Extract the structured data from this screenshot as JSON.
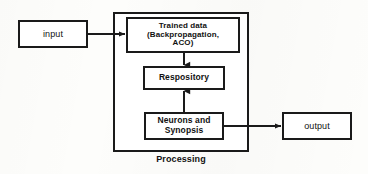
{
  "figure": {
    "type": "block-diagram",
    "background_color": "#fdfdfb",
    "stroke_color": "#1a1a1a",
    "fill_color": "#ffffff"
  },
  "nodes": {
    "input": {
      "label": "input",
      "shape": "rectangle"
    },
    "output": {
      "label": "output",
      "shape": "rectangle"
    },
    "trained_data": {
      "label": "Trained data\n(Backpropagation,\nACO)",
      "shape": "rectangle"
    },
    "respository": {
      "label": "Respository",
      "shape": "rectangle"
    },
    "neurons": {
      "label": "Neurons and\nSynopsis",
      "shape": "rectangle"
    }
  },
  "container": {
    "caption": "Processing",
    "shape": "rectangle"
  },
  "edges": [
    {
      "name": "input-to-trained-data",
      "from": "input",
      "to": "trained_data",
      "direction": "right",
      "arrowhead": true
    },
    {
      "name": "trained-data-to-respository",
      "from": "trained_data",
      "to": "respository",
      "direction": "down",
      "arrowhead": true
    },
    {
      "name": "neurons-to-respository",
      "from": "neurons",
      "to": "respository",
      "direction": "up",
      "arrowhead": true
    },
    {
      "name": "neurons-to-output",
      "from": "neurons",
      "to": "output",
      "direction": "right",
      "arrowhead": true
    }
  ]
}
